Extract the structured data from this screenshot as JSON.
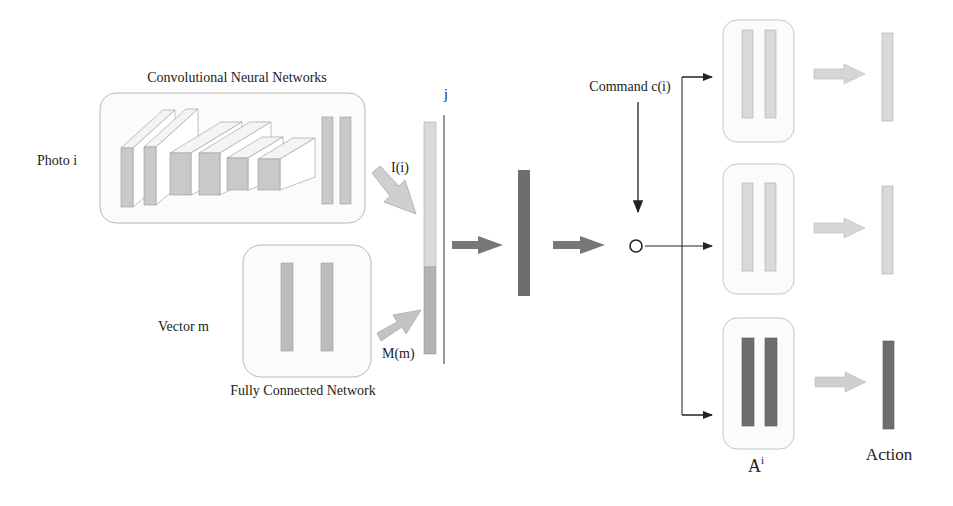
{
  "labels": {
    "cnn_title": "Convolutional Neural Networks",
    "photo": "Photo  i",
    "vector": "Vector  m",
    "fcn_title": "Fully Connected Network",
    "image_feature": "I(i)",
    "measure_feature": "M(m)",
    "joint": "j",
    "command": "Command  c(i)",
    "branch": "A",
    "branch_sup": "i",
    "action": "Action"
  },
  "colors": {
    "light_bar": "#d9d9d9",
    "mid_bar": "#b3b3b3",
    "dark_bar": "#6e6e6e",
    "box_border": "#b8b8b8",
    "box_fill": "#fbfbfb",
    "line": "#222222"
  }
}
